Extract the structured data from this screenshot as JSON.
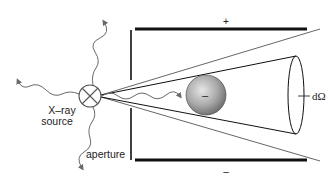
{
  "diagram": {
    "labels": {
      "source_line1": "X–ray",
      "source_line2": "source",
      "aperture": "aperture",
      "solid_angle": "dΩ",
      "top_plate_sign": "+",
      "bottom_plate_sign": "–",
      "particle_charge": "–"
    },
    "colors": {
      "line": "#111111",
      "ray": "#6a6a6a",
      "sphere_light": "#e6e6e6",
      "sphere_dark": "#7a7a7a"
    }
  }
}
